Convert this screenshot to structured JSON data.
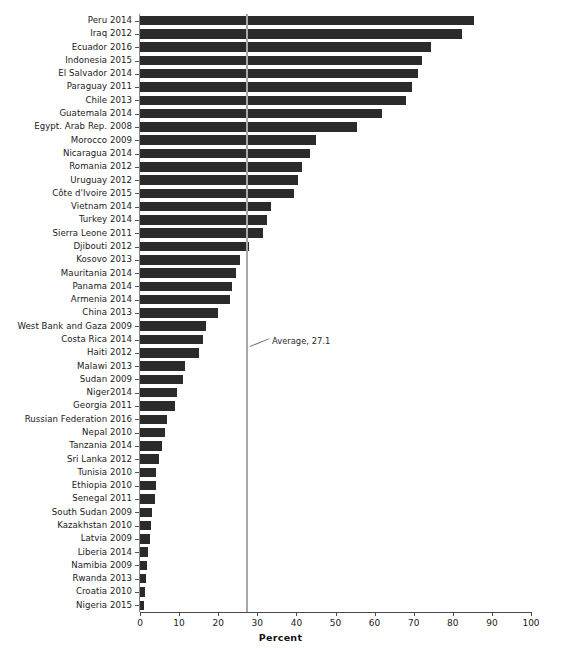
{
  "chart_data": {
    "type": "bar",
    "orientation": "horizontal",
    "title": "",
    "xlabel": "Percent",
    "ylabel": "",
    "xlim": [
      0,
      100
    ],
    "xticks": [
      0,
      10,
      20,
      30,
      40,
      50,
      60,
      70,
      80,
      90,
      100
    ],
    "grid": false,
    "legend": null,
    "bar_color": "#2b2b2b",
    "annotations": [
      {
        "name": "average-line",
        "label": "Average, 27.1",
        "value": 27.1,
        "type": "vertical-reference-line",
        "color": "#a8a8a8"
      }
    ],
    "categories": [
      "Peru 2014",
      "Iraq 2012",
      "Ecuador 2016",
      "Indonesia 2015",
      "El Salvador 2014",
      "Paraguay 2011",
      "Chile 2013",
      "Guatemala 2014",
      "Egypt. Arab Rep. 2008",
      "Morocco 2009",
      "Nicaragua 2014",
      "Romania 2012",
      "Uruguay 2012",
      "Côte d'Ivoire 2015",
      "Vietnam 2014",
      "Turkey 2014",
      "Sierra Leone 2011",
      "Djibouti 2012",
      "Kosovo 2013",
      "Mauritania 2014",
      "Panama 2014",
      "Armenia 2014",
      "China 2013",
      "West Bank and Gaza 2009",
      "Costa Rica 2014",
      "Haiti 2012",
      "Malawi 2013",
      "Sudan 2009",
      "Niger2014",
      "Georgia 2011",
      "Russian Federation 2016",
      "Nepal 2010",
      "Tanzania 2014",
      "Sri Lanka 2012",
      "Tunisia 2010",
      "Ethiopia 2010",
      "Senegal 2011",
      "South Sudan 2009",
      "Kazakhstan 2010",
      "Latvia 2009",
      "Liberia 2014",
      "Namibia 2009",
      "Rwanda 2013",
      "Croatia 2010",
      "Nigeria 2015"
    ],
    "values": [
      85.4,
      82.4,
      74.5,
      72.0,
      71.0,
      69.5,
      68.0,
      62.0,
      55.5,
      45.0,
      43.5,
      41.5,
      40.5,
      39.5,
      33.5,
      32.5,
      31.5,
      28.0,
      25.5,
      24.5,
      23.5,
      23.0,
      20.0,
      17.0,
      16.0,
      15.0,
      11.5,
      11.0,
      9.5,
      9.0,
      7.0,
      6.5,
      5.5,
      4.8,
      4.2,
      4.0,
      3.8,
      3.0,
      2.8,
      2.6,
      2.0,
      1.7,
      1.5,
      1.3,
      1.0
    ]
  },
  "axis": {
    "x_title": "Percent",
    "tick_labels": [
      "0",
      "10",
      "20",
      "30",
      "40",
      "50",
      "60",
      "70",
      "80",
      "90",
      "100"
    ]
  },
  "annotation": {
    "average_label": "Average, 27.1"
  }
}
